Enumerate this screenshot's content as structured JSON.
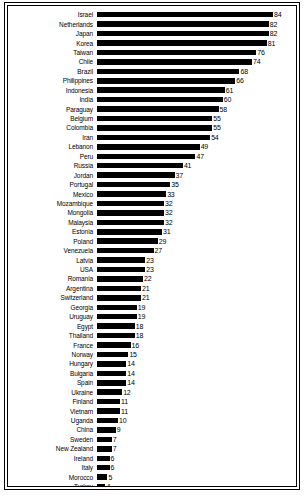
{
  "chart_data": {
    "type": "bar",
    "orientation": "horizontal",
    "title": "",
    "subtitle": "",
    "xlabel": "",
    "ylabel": "",
    "xlim": [
      0,
      84
    ],
    "grid": false,
    "legend": null,
    "bar_color": "#000000",
    "background_color": "#ffffff",
    "categories": [
      "Israel",
      "Netherlands",
      "Japan",
      "Korea",
      "Taiwan",
      "Chile",
      "Brazil",
      "Philippines",
      "Indonesia",
      "India",
      "Paraguay",
      "Belgium",
      "Colombia",
      "Iran",
      "Lebanon",
      "Peru",
      "Russia",
      "Jordan",
      "Portugal",
      "Mexico",
      "Mozambique",
      "Mongolia",
      "Malaysia",
      "Estonia",
      "Poland",
      "Venezuela",
      "Latvia",
      "USA",
      "Romania",
      "Argentina",
      "Switzerland",
      "Georgia",
      "Uruguay",
      "Egypt",
      "Thailand",
      "France",
      "Norway",
      "Hungary",
      "Bulgaria",
      "Spain",
      "Ukraine",
      "Finland",
      "Vietnam",
      "Uganda",
      "China",
      "Sweden",
      "New Zealand",
      "Ireland",
      "Italy",
      "Morocco",
      "Turkey",
      "Hong Kong"
    ],
    "values": [
      84,
      82,
      82,
      81,
      76,
      74,
      68,
      66,
      61,
      60,
      58,
      55,
      55,
      54,
      49,
      47,
      41,
      37,
      35,
      33,
      32,
      32,
      32,
      31,
      29,
      27,
      23,
      23,
      22,
      21,
      21,
      19,
      19,
      18,
      18,
      16,
      15,
      14,
      14,
      14,
      12,
      11,
      11,
      10,
      9,
      7,
      7,
      6,
      6,
      5,
      4,
      3
    ],
    "value_labels": [
      "84",
      "82",
      "82",
      "81",
      "76",
      "74",
      "68",
      "66",
      "61",
      "60",
      "58",
      "55",
      "55",
      "54",
      "49",
      "47",
      "41",
      "37",
      "35",
      "33",
      "32",
      "32",
      "32",
      "31",
      "29",
      "27",
      "23",
      "23",
      "22",
      "21",
      "21",
      "19",
      "19",
      "18",
      "18",
      "16",
      "15",
      "14",
      "14",
      "14",
      "12",
      "11",
      "11",
      "10",
      "9",
      "7",
      "7",
      "6",
      "6",
      "5",
      "4",
      "3"
    ]
  },
  "caption": ""
}
